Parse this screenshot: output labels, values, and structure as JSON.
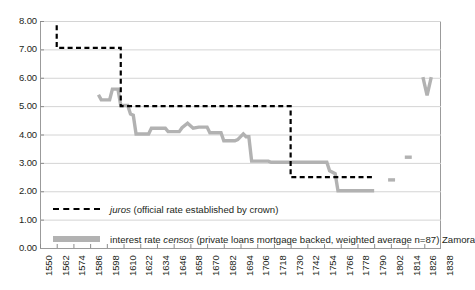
{
  "chart_data": {
    "type": "line",
    "title": "",
    "xlabel": "",
    "ylabel": "",
    "xlim": [
      1550,
      1838
    ],
    "ylim": [
      0,
      8
    ],
    "ytick_step": 1,
    "xtick_step": 12,
    "grid": "horizontal",
    "legend_position": "bottom-inside",
    "ytick_labels": [
      "0.00",
      "1.00",
      "2.00",
      "3.00",
      "4.00",
      "5.00",
      "6.00",
      "7.00",
      "8.00"
    ],
    "xtick_labels": [
      "1550",
      "1562",
      "1574",
      "1586",
      "1598",
      "1610",
      "1622",
      "1634",
      "1646",
      "1658",
      "1670",
      "1682",
      "1694",
      "1706",
      "1718",
      "1730",
      "1742",
      "1754",
      "1766",
      "1778",
      "1790",
      "1802",
      "1814",
      "1826",
      "1838"
    ],
    "colors": {
      "juros": "#000000",
      "censos": "#b2b2b2",
      "grid": "#d4d4d4",
      "axis": "#8c8c8c",
      "text": "#231f20"
    },
    "series": [
      {
        "name": "juros",
        "legend_label": "juros (official rate established by crown)",
        "legend_label_italic_prefix": "juros",
        "legend_label_rest": " (official rate established by crown)",
        "style": "dashed",
        "color": "#000000",
        "points": [
          [
            1562,
            7.85
          ],
          [
            1562,
            7.05
          ],
          [
            1608,
            7.05
          ],
          [
            1608,
            5.0
          ],
          [
            1621,
            5.0
          ],
          [
            1621,
            5.0
          ],
          [
            1730,
            5.0
          ],
          [
            1730,
            2.5
          ],
          [
            1790,
            2.5
          ]
        ]
      },
      {
        "name": "censos",
        "legend_label": "interest rate censos (private loans mortgage backed, weighted average n=87) Zamora",
        "legend_label_pre": "interest rate ",
        "legend_label_italic": "censos",
        "legend_label_post": " (private loans mortgage backed, weighted average n=87) Zamora",
        "style": "solid",
        "color": "#b2b2b2",
        "points": [
          [
            1592,
            5.4
          ],
          [
            1594,
            5.22
          ],
          [
            1600,
            5.22
          ],
          [
            1602,
            5.6
          ],
          [
            1606,
            5.6
          ],
          [
            1608,
            5.02
          ],
          [
            1613,
            5.02
          ],
          [
            1615,
            4.72
          ],
          [
            1617,
            4.68
          ],
          [
            1619,
            4.02
          ],
          [
            1628,
            4.02
          ],
          [
            1630,
            4.22
          ],
          [
            1640,
            4.22
          ],
          [
            1642,
            4.1
          ],
          [
            1650,
            4.1
          ],
          [
            1652,
            4.24
          ],
          [
            1656,
            4.4
          ],
          [
            1660,
            4.22
          ],
          [
            1664,
            4.26
          ],
          [
            1670,
            4.26
          ],
          [
            1672,
            4.06
          ],
          [
            1680,
            4.06
          ],
          [
            1682,
            3.78
          ],
          [
            1690,
            3.78
          ],
          [
            1692,
            3.82
          ],
          [
            1696,
            4.02
          ],
          [
            1698,
            3.92
          ],
          [
            1700,
            3.92
          ],
          [
            1702,
            3.06
          ],
          [
            1714,
            3.06
          ],
          [
            1716,
            3.02
          ],
          [
            1750,
            3.02
          ],
          [
            1756,
            3.02
          ],
          [
            1758,
            2.72
          ],
          [
            1762,
            2.62
          ],
          [
            1764,
            2.02
          ],
          [
            1790,
            2.02
          ]
        ],
        "isolated_segments": [
          {
            "x_start": 1800,
            "x_end": 1805,
            "y": 2.4
          },
          {
            "x_start": 1812,
            "x_end": 1817,
            "y": 3.2
          },
          {
            "x_start": 1825,
            "y_start": 6.02,
            "x_mid": 1828,
            "y_mid": 5.38,
            "x_end": 1831,
            "y_end": 6.02,
            "shape": "v"
          }
        ]
      }
    ]
  }
}
